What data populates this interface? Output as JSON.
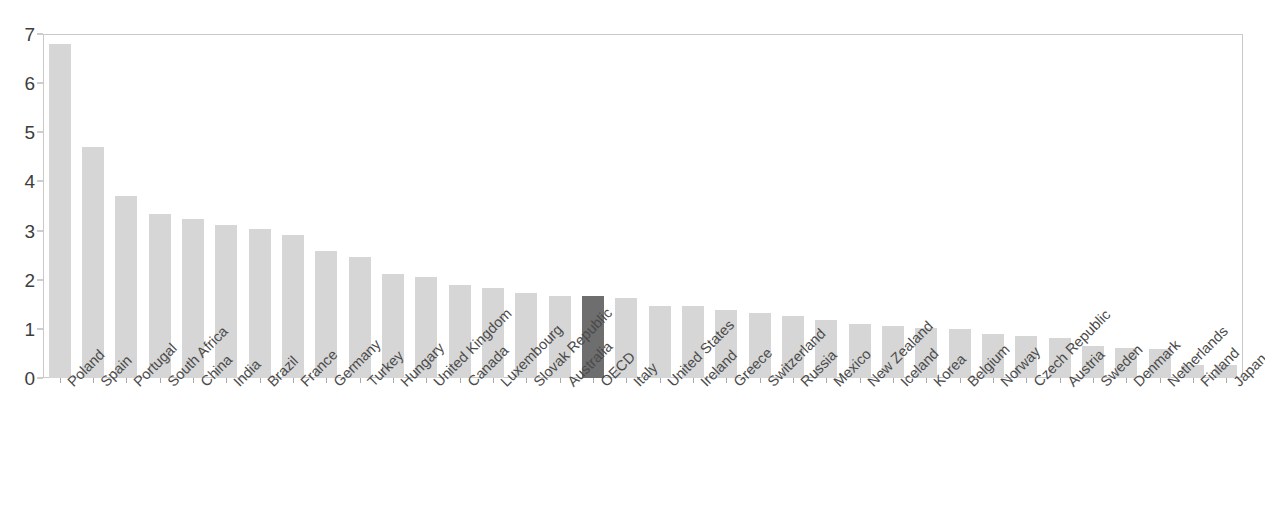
{
  "chart_data": {
    "type": "bar",
    "title": "",
    "subtitle": "",
    "xlabel": "",
    "ylabel": "",
    "ylim": [
      0,
      7
    ],
    "yticks": [
      0,
      1,
      2,
      3,
      4,
      5,
      6,
      7
    ],
    "ytick_labels": [
      "0",
      "1",
      "2",
      "3",
      "4",
      "5",
      "6",
      "7"
    ],
    "grid": false,
    "legend": null,
    "highlight_category": "OECD",
    "colors": {
      "bar": "#d6d6d6",
      "highlight_bar": "#6e6e6e",
      "axis": "#c9c9c9",
      "tick_text": "#3d3d3d",
      "label_text": "#4a4a4a",
      "background": "#ffffff"
    },
    "categories": [
      "Poland",
      "Spain",
      "Portugal",
      "South Africa",
      "China",
      "India",
      "Brazil",
      "France",
      "Germany",
      "Turkey",
      "Hungary",
      "United Kingdom",
      "Canada",
      "Luxembourg",
      "Slovak Republic",
      "Australia",
      "OECD",
      "Italy",
      "United States",
      "Ireland",
      "Greece",
      "Switzerland",
      "Russia",
      "Mexico",
      "New Zealand",
      "Iceland",
      "Korea",
      "Belgium",
      "Norway",
      "Czech Republic",
      "Austria",
      "Sweden",
      "Denmark",
      "Netherlands",
      "Finland",
      "Japan"
    ],
    "values": [
      6.8,
      4.7,
      3.7,
      3.34,
      3.24,
      3.11,
      3.04,
      2.92,
      2.58,
      2.47,
      2.11,
      2.05,
      1.9,
      1.84,
      1.72,
      1.67,
      1.66,
      1.62,
      1.47,
      1.46,
      1.39,
      1.32,
      1.27,
      1.18,
      1.09,
      1.05,
      1.02,
      1.0,
      0.89,
      0.85,
      0.81,
      0.66,
      0.62,
      0.6,
      0.27,
      0.26
    ]
  }
}
